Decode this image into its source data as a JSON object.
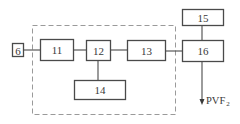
{
  "diagram": {
    "type": "block-diagram",
    "colors": {
      "stroke": "#4a4a4a",
      "dashed_border": "#9a9a9a",
      "background": "#ffffff"
    },
    "blocks": [
      {
        "id": "6",
        "label": "6"
      },
      {
        "id": "11",
        "label": "11"
      },
      {
        "id": "12",
        "label": "12"
      },
      {
        "id": "13",
        "label": "13"
      },
      {
        "id": "14",
        "label": "14"
      },
      {
        "id": "15",
        "label": "15"
      },
      {
        "id": "16",
        "label": "16"
      }
    ],
    "connections": [
      {
        "from": "6",
        "to": "11"
      },
      {
        "from": "11",
        "to": "12"
      },
      {
        "from": "12",
        "to": "13"
      },
      {
        "from": "12",
        "to": "14"
      },
      {
        "from": "13",
        "to": "16"
      },
      {
        "from": "15",
        "to": "16"
      },
      {
        "from": "16",
        "to": "output"
      }
    ],
    "dashed_group": [
      "11",
      "12",
      "13",
      "14"
    ],
    "output": {
      "label": "PVF",
      "subscript": "2"
    }
  }
}
